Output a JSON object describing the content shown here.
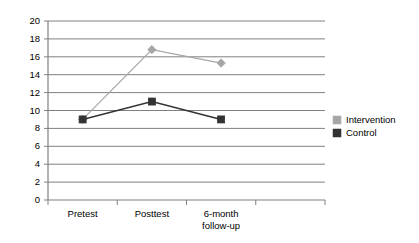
{
  "chart_data": {
    "type": "line",
    "title": "",
    "subtitle": "",
    "xlabel": "",
    "ylabel": "",
    "categories": [
      "Pretest",
      "Posttest",
      "6-month follow-up",
      ""
    ],
    "category_lines": [
      [
        "Pretest"
      ],
      [
        "Posttest"
      ],
      [
        "6-month",
        "follow-up"
      ],
      [
        ""
      ]
    ],
    "ylim": [
      0,
      20
    ],
    "ytick_step": 2,
    "yticks": [
      "0",
      "2",
      "4",
      "6",
      "8",
      "10",
      "12",
      "14",
      "16",
      "18",
      "20"
    ],
    "grid": true,
    "grid_axis": "y",
    "legend_position": "right",
    "series": [
      {
        "name": "Intervention",
        "color": "#a6a6a6",
        "marker": "diamond",
        "values": [
          9,
          16.8,
          15.3,
          null
        ]
      },
      {
        "name": "Control",
        "color": "#333333",
        "marker": "square",
        "values": [
          9,
          11,
          9,
          null
        ]
      }
    ]
  },
  "legend": {
    "items": [
      {
        "label": "Intervention",
        "color": "#a6a6a6"
      },
      {
        "label": "Control",
        "color": "#333333"
      }
    ]
  },
  "colors": {
    "intervention": "#a6a6a6",
    "control": "#333333",
    "gridline": "#808080",
    "axis": "#808080",
    "background": "#ffffff",
    "text": "#000000"
  }
}
